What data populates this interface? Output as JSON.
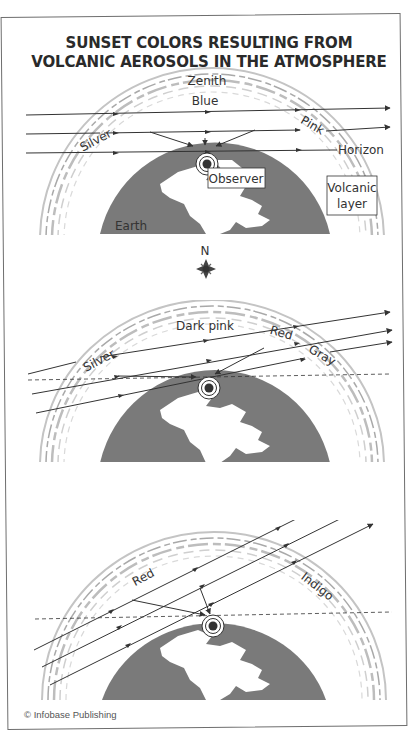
{
  "title": {
    "line1": "SUNSET COLORS RESULTING FROM",
    "line2": "VOLCANIC AEROSOLS IN THE ATMOSPHERE"
  },
  "panel1": {
    "labels": {
      "zenith": "Zenith",
      "blue": "Blue",
      "silver": "Silver",
      "pink": "Pink",
      "horizon": "Horizon",
      "observer": "Observer",
      "volcanic_line1": "Volcanic",
      "volcanic_line2": "layer",
      "earth": "Earth"
    }
  },
  "compass": {
    "north": "N"
  },
  "panel2": {
    "labels": {
      "dark_pink": "Dark pink",
      "silver": "Silver",
      "red": "Red",
      "gray": "Gray"
    }
  },
  "panel3": {
    "labels": {
      "red": "Red",
      "indigo": "Indigo"
    }
  },
  "credit": "© Infobase Publishing",
  "colors": {
    "earth": "#7a7a7a",
    "line": "#333333",
    "aerosol": "#b8b8b8",
    "frame": "#6e6e6e"
  }
}
